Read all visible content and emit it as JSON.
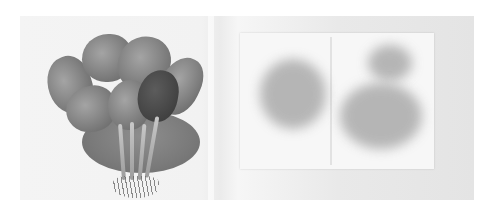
{
  "image": {
    "description": "Grayscale photograph: a bunch of spinach with roots on a round plate (left) beside a folded sheet of translucent paper showing dark leaf imprints (right)",
    "subjects": {
      "left": "spinach-bunch-on-plate",
      "right": "paper-with-leaf-imprints"
    },
    "palette": {
      "background": "#f2f2f2",
      "plate": "#7a7a7a",
      "leaves": "#8a8a8a",
      "paper": "#f7f7f7",
      "imprints": "#9a9a9a"
    }
  }
}
